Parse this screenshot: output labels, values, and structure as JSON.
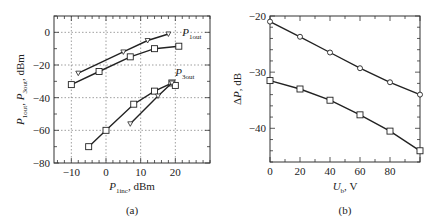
{
  "chart_data": [
    {
      "id": "a",
      "type": "line",
      "caption": "(a)",
      "xlabel": "P1inc, dBm",
      "ylabel": "P1out, P3out, dBm",
      "xlim": [
        -15,
        30
      ],
      "ylim": [
        -80,
        10
      ],
      "xticks": [
        -10,
        0,
        10,
        20
      ],
      "yticks": [
        0,
        -20,
        -40,
        -60,
        -80
      ],
      "grid": true,
      "series": [
        {
          "name": "P1out (triangle)",
          "marker": "triangle",
          "x": [
            -8,
            5,
            12,
            18
          ],
          "y": [
            -25,
            -12,
            -5,
            -1
          ]
        },
        {
          "name": "P1out (square)",
          "marker": "square",
          "x": [
            -10,
            -2,
            7,
            14,
            21
          ],
          "y": [
            -32,
            -24,
            -15,
            -10,
            -8.5
          ]
        },
        {
          "name": "P3out (square)",
          "marker": "square",
          "x": [
            -5,
            0,
            8,
            14,
            19,
            20
          ],
          "y": [
            -70,
            -60,
            -44,
            -36,
            -31,
            -32.5
          ]
        },
        {
          "name": "P3out (triangle)",
          "marker": "triangle",
          "x": [
            7,
            15,
            19
          ],
          "y": [
            -56,
            -39,
            -31
          ]
        }
      ],
      "annotations": [
        {
          "text": "P1out",
          "x": 22,
          "y": -2
        },
        {
          "text": "P3out",
          "x": 20,
          "y": -27
        }
      ]
    },
    {
      "id": "b",
      "type": "line",
      "caption": "(b)",
      "xlabel": "Ub, V",
      "ylabel": "ΔP, dB",
      "xlim": [
        0,
        100
      ],
      "ylim": [
        -46,
        -20
      ],
      "xticks": [
        0,
        20,
        40,
        60,
        80
      ],
      "yticks": [
        -20,
        -30,
        -40
      ],
      "grid": false,
      "series": [
        {
          "name": "upper (circle)",
          "marker": "circle",
          "x": [
            0,
            20,
            40,
            60,
            80,
            100
          ],
          "y": [
            -21,
            -23.7,
            -26.5,
            -29.3,
            -31.8,
            -34
          ]
        },
        {
          "name": "lower (square)",
          "marker": "square",
          "x": [
            0,
            20,
            40,
            60,
            80,
            100
          ],
          "y": [
            -31.5,
            -33,
            -35,
            -37.6,
            -40.5,
            -44
          ]
        }
      ]
    }
  ]
}
